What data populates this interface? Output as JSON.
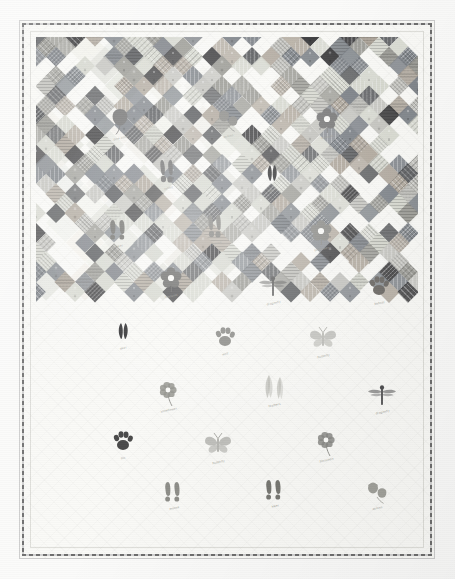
{
  "image": {
    "subject": "Nature-themed appliqué quilt",
    "type": "photograph",
    "width": 455,
    "height": 579
  },
  "quilt": {
    "layout": "on-point diagonal chain grid",
    "background_fabric": "cream white",
    "binding": "dark print binding",
    "border": "plain white outer border with background quilting",
    "cell": 19.6,
    "columns": 20,
    "rows": 26,
    "colors": {
      "cream": "#f7f6f1",
      "white": "#fcfcfa",
      "dark_charcoal": "#3a3a3c",
      "charcoal": "#55575a",
      "slate": "#7d8288",
      "warm_gray": "#9a9a94",
      "light_gray": "#c2c2bd",
      "taupe": "#b0a89d",
      "pale_sage": "#d6d8cf",
      "binding": "#6d6d6d"
    }
  },
  "chain": {
    "note": "Diamond squares set on point forming a double-Irish-chain style lattice",
    "palette_order": [
      "dark_charcoal",
      "charcoal",
      "slate",
      "warm_gray",
      "light_gray",
      "taupe",
      "pale_sage"
    ]
  },
  "motifs": [
    {
      "name": "pine-cone",
      "label": "pine cone",
      "x": 100,
      "y": 100,
      "scale": 1.0,
      "tone": "#6f6f6f"
    },
    {
      "name": "flower-blossom",
      "label": "blossom",
      "x": 307,
      "y": 99,
      "scale": 1.0,
      "tone": "#7a7a7a"
    },
    {
      "name": "acorn-pair",
      "label": "acorns",
      "x": 208,
      "y": 98,
      "scale": 1.0,
      "tone": "#8a8a86"
    },
    {
      "name": "rabbit-tracks",
      "label": "rabbit",
      "x": 148,
      "y": 150,
      "scale": 1.0,
      "tone": "#6b6b6b"
    },
    {
      "name": "deer-track",
      "label": "deer",
      "x": 252,
      "y": 152,
      "scale": 1.0,
      "tone": "#2e2e30"
    },
    {
      "name": "bird-tracks",
      "label": "grouse",
      "x": 196,
      "y": 205,
      "scale": 1.0,
      "tone": "#7e7e7a"
    },
    {
      "name": "boot-prints",
      "label": "hiker",
      "x": 99,
      "y": 208,
      "scale": 1.0,
      "tone": "#6e6e6a"
    },
    {
      "name": "bell-flower",
      "label": "bellflower",
      "x": 301,
      "y": 211,
      "scale": 1.0,
      "tone": "#8c8c88"
    },
    {
      "name": "flower-blossom-2",
      "label": "blossom",
      "x": 151,
      "y": 258,
      "scale": 1.0,
      "tone": "#6a6a68"
    },
    {
      "name": "dragonfly",
      "label": "dragonfly",
      "x": 253,
      "y": 265,
      "scale": 1.0,
      "tone": "#5a5a5a"
    },
    {
      "name": "paw-print",
      "label": "bobcat",
      "x": 359,
      "y": 265,
      "scale": 1.0,
      "tone": "#6d6a66"
    },
    {
      "name": "deer-track-2",
      "label": "deer",
      "x": 103,
      "y": 310,
      "scale": 1.0,
      "tone": "#262628"
    },
    {
      "name": "paw-print-2",
      "label": "wolf",
      "x": 205,
      "y": 316,
      "scale": 1.0,
      "tone": "#8b8b87"
    },
    {
      "name": "butterfly",
      "label": "butterfly",
      "x": 303,
      "y": 318,
      "scale": 1.0,
      "tone": "#a5a5a0"
    },
    {
      "name": "feather-pair",
      "label": "feathers",
      "x": 254,
      "y": 367,
      "scale": 1.0,
      "tone": "#b4b4ae"
    },
    {
      "name": "dragonfly-2",
      "label": "dragonfly",
      "x": 362,
      "y": 374,
      "scale": 1.0,
      "tone": "#4e4e50"
    },
    {
      "name": "flower-stem",
      "label": "coneflower",
      "x": 148,
      "y": 372,
      "scale": 1.0,
      "tone": "#8f8f8a"
    },
    {
      "name": "paw-print-3",
      "label": "fox",
      "x": 103,
      "y": 420,
      "scale": 1.0,
      "tone": "#4a4a4a"
    },
    {
      "name": "butterfly-2",
      "label": "butterfly",
      "x": 198,
      "y": 424,
      "scale": 1.0,
      "tone": "#9c9c97"
    },
    {
      "name": "flower-cluster",
      "label": "blossoms",
      "x": 306,
      "y": 422,
      "scale": 1.0,
      "tone": "#8a8a86"
    },
    {
      "name": "moose-track",
      "label": "moose",
      "x": 154,
      "y": 470,
      "scale": 1.0,
      "tone": "#8e8e89"
    },
    {
      "name": "boot-prints-2",
      "label": "hiker",
      "x": 255,
      "y": 468,
      "scale": 1.0,
      "tone": "#777772"
    },
    {
      "name": "acorn-pair-2",
      "label": "acorns",
      "x": 357,
      "y": 470,
      "scale": 1.0,
      "tone": "#a0a09a"
    }
  ]
}
